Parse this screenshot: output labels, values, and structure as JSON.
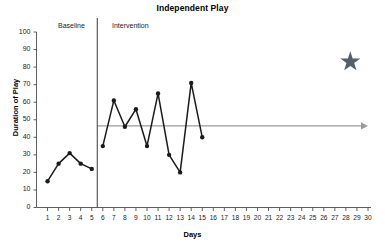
{
  "chart_data": {
    "type": "line",
    "title": "Independent Play",
    "xlabel": "Days",
    "ylabel": "Duration of Play",
    "xlim": [
      0,
      30
    ],
    "ylim": [
      0,
      100
    ],
    "ytick_step": 10,
    "grid": false,
    "legend": null,
    "x": [
      1,
      2,
      3,
      4,
      5,
      6,
      7,
      8,
      9,
      10,
      11,
      12,
      13,
      14,
      15
    ],
    "xticks": [
      1,
      2,
      3,
      4,
      5,
      6,
      7,
      8,
      9,
      10,
      11,
      12,
      13,
      14,
      15,
      16,
      17,
      18,
      19,
      20,
      21,
      22,
      23,
      24,
      25,
      26,
      27,
      28,
      29,
      30
    ],
    "yticks": [
      0,
      10,
      20,
      30,
      40,
      50,
      60,
      70,
      80,
      90,
      100
    ],
    "series": [
      {
        "name": "Baseline",
        "x": [
          1,
          2,
          3,
          4,
          5
        ],
        "values": [
          15,
          25,
          31,
          25,
          22
        ],
        "color": "#1a1a1a"
      },
      {
        "name": "Intervention",
        "x": [
          6,
          7,
          8,
          9,
          10,
          11,
          12,
          13,
          14,
          15
        ],
        "values": [
          35,
          61,
          46,
          56,
          35,
          65,
          30,
          20,
          71,
          40
        ],
        "color": "#1a1a1a"
      }
    ],
    "annotations": {
      "phase_line": {
        "label": "phase-change-line",
        "x": 5.5,
        "color": "#4d4d4d"
      },
      "phase_labels": [
        {
          "text": "Baseline",
          "x": 1.1,
          "y": 101
        },
        {
          "text": "Intervention",
          "x": 6.0,
          "y": 101
        }
      ],
      "trend_arrow": {
        "label": "goal-level-arrow",
        "y": 46.5,
        "x_start": 5.5,
        "x_end": 30,
        "color": "#9a9a9a"
      },
      "star": {
        "label": "goal-star",
        "x": 28.4,
        "y": 83,
        "color": "#555f6b"
      }
    }
  }
}
